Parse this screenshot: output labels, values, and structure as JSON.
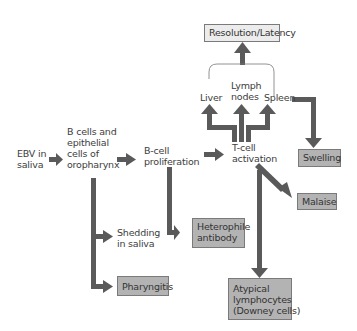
{
  "diagram": {
    "nodes": {
      "ebv": [
        "EBV in",
        "saliva"
      ],
      "bcells": [
        "B cells and",
        "epithelial",
        "cells of",
        "oropharynx"
      ],
      "bprolif": [
        "B-cell",
        "proliferation"
      ],
      "tcell": [
        "T-cell",
        "activation"
      ],
      "liver": "Liver",
      "lymph": [
        "Lymph",
        "nodes"
      ],
      "spleen": "Spleen",
      "resolution": "Resolution/Latency",
      "swelling": "Swelling",
      "malaise": "Malaise",
      "shedding": [
        "Shedding",
        "in saliva"
      ],
      "pharyngitis": "Pharyngitis",
      "heterophile": [
        "Heterophile",
        "antibody"
      ],
      "atypical": [
        "Atypical",
        "lymphocytes",
        "(Downey cells)"
      ]
    },
    "colors": {
      "arrow": "#5a5a5a",
      "box_fill": "#b3b3b3",
      "box_light_fill": "#ececec",
      "box_border": "#7a7a7a",
      "text": "#3d3d3d"
    }
  }
}
